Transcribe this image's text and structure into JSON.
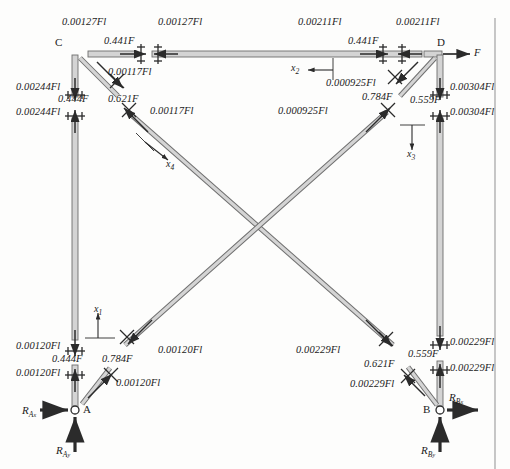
{
  "figure": {
    "type": "free-body-diagram",
    "title": "",
    "ink_color": "#2b2b2b",
    "member_fill": "#d9d9d9",
    "member_stroke": "#6e6e6e"
  },
  "nodes": {
    "C": {
      "label": "C",
      "x": 75,
      "y": 55
    },
    "D": {
      "label": "D",
      "x": 440,
      "y": 55
    },
    "A": {
      "label": "A",
      "x": 75,
      "y": 410
    },
    "B": {
      "label": "B",
      "x": 440,
      "y": 410
    }
  },
  "applied_load": {
    "label": "F",
    "at": "D",
    "direction": "right"
  },
  "reactions": [
    {
      "name": "R_Ax",
      "base": "R",
      "sub": "A",
      "comp": "x",
      "text": "R",
      "node": "A",
      "direction": "right"
    },
    {
      "name": "R_Ay",
      "base": "R",
      "sub": "A",
      "comp": "y",
      "text": "R",
      "node": "A",
      "direction": "up"
    },
    {
      "name": "R_Bx",
      "base": "R",
      "sub": "B",
      "comp": "x",
      "text": "R",
      "node": "B",
      "direction": "right"
    },
    {
      "name": "R_By",
      "base": "R",
      "sub": "B",
      "comp": "y",
      "text": "R",
      "node": "B",
      "direction": "up"
    }
  ],
  "axes": [
    {
      "name": "x1",
      "label": "x",
      "sub": "1",
      "direction": "up",
      "member": "left-column"
    },
    {
      "name": "x2",
      "label": "x",
      "sub": "2",
      "direction": "left",
      "member": "top-beam"
    },
    {
      "name": "x3",
      "label": "x",
      "sub": "3",
      "direction": "down",
      "member": "right-column"
    },
    {
      "name": "x4",
      "label": "x",
      "sub": "4",
      "direction": "down-right",
      "member": "diagonal-C-B"
    }
  ],
  "labels": [
    {
      "id": "m_c_top_left",
      "text": "0.00127Fl",
      "x": 62,
      "y": 22,
      "kind": "moment",
      "member": "top-beam-left-end"
    },
    {
      "id": "m_c_top_right",
      "text": "0.00127Fl",
      "x": 158,
      "y": 22,
      "kind": "moment",
      "member": "top-beam-left-end"
    },
    {
      "id": "f_c_top",
      "text": "0.441F",
      "x": 108,
      "y": 41,
      "kind": "force",
      "member": "top-beam-left-end"
    },
    {
      "id": "m_c_diag",
      "text": "0.00117Fl",
      "x": 110,
      "y": 68,
      "kind": "moment",
      "member": "diagonal-C-B"
    },
    {
      "id": "m_c_col_upper",
      "text": "0.00244Fl",
      "x": 18,
      "y": 86,
      "kind": "moment",
      "member": "left-column-top"
    },
    {
      "id": "f_c_col",
      "text": "0.444F",
      "x": 60,
      "y": 98,
      "kind": "force",
      "member": "left-column-top"
    },
    {
      "id": "m_c_col_lower",
      "text": "0.00244Fl",
      "x": 18,
      "y": 112,
      "kind": "moment",
      "member": "left-column-top"
    },
    {
      "id": "f_diag_c",
      "text": "0.621F",
      "x": 110,
      "y": 98,
      "kind": "force",
      "member": "diagonal-C-B"
    },
    {
      "id": "m_diag_c",
      "text": "0.00117Fl",
      "x": 152,
      "y": 110,
      "kind": "moment",
      "member": "diagonal-C-B"
    },
    {
      "id": "m_d_top_left",
      "text": "0.00211Fl",
      "x": 300,
      "y": 22,
      "kind": "moment",
      "member": "top-beam-right-end"
    },
    {
      "id": "m_d_top_right",
      "text": "0.00211Fl",
      "x": 398,
      "y": 22,
      "kind": "moment",
      "member": "top-beam-right-end"
    },
    {
      "id": "f_d_top",
      "text": "0.441F",
      "x": 352,
      "y": 41,
      "kind": "force",
      "member": "top-beam-right-end"
    },
    {
      "id": "m_d_diag",
      "text": "0.000925Fl",
      "x": 330,
      "y": 82,
      "kind": "moment",
      "member": "diagonal-D-A"
    },
    {
      "id": "m_d_col_upper",
      "text": "0.00304Fl",
      "x": 452,
      "y": 86,
      "kind": "moment",
      "member": "right-column-top"
    },
    {
      "id": "f_d_col",
      "text": "0.559F",
      "x": 412,
      "y": 99,
      "kind": "force",
      "member": "right-column-top"
    },
    {
      "id": "m_d_col_lower",
      "text": "0.00304Fl",
      "x": 452,
      "y": 112,
      "kind": "moment",
      "member": "right-column-top"
    },
    {
      "id": "f_diag_d",
      "text": "0.784F",
      "x": 364,
      "y": 96,
      "kind": "force",
      "member": "diagonal-D-A"
    },
    {
      "id": "m_diag_d",
      "text": "0.000925Fl",
      "x": 282,
      "y": 110,
      "kind": "moment",
      "member": "diagonal-D-A"
    },
    {
      "id": "m_a_col_upper",
      "text": "0.00120Fl",
      "x": 18,
      "y": 345,
      "kind": "moment",
      "member": "left-column-bottom"
    },
    {
      "id": "f_a_col",
      "text": "0.444F",
      "x": 54,
      "y": 358,
      "kind": "force",
      "member": "left-column-bottom"
    },
    {
      "id": "m_a_col_lower",
      "text": "0.00120Fl",
      "x": 18,
      "y": 372,
      "kind": "moment",
      "member": "left-column-bottom"
    },
    {
      "id": "f_diag_a",
      "text": "0.784F",
      "x": 104,
      "y": 358,
      "kind": "force",
      "member": "diagonal-D-A"
    },
    {
      "id": "m_diag_a_upper",
      "text": "0.00120Fl",
      "x": 160,
      "y": 349,
      "kind": "moment",
      "member": "diagonal-D-A"
    },
    {
      "id": "m_diag_a_lower",
      "text": "0.00120Fl",
      "x": 118,
      "y": 382,
      "kind": "moment",
      "member": "diagonal-D-A"
    },
    {
      "id": "m_b_col_upper",
      "text": "0.00229Fl",
      "x": 452,
      "y": 341,
      "kind": "moment",
      "member": "right-column-bottom"
    },
    {
      "id": "f_b_col",
      "text": "0.559F",
      "x": 412,
      "y": 353,
      "kind": "force",
      "member": "right-column-bottom"
    },
    {
      "id": "m_b_col_lower",
      "text": "0.00229Fl",
      "x": 452,
      "y": 367,
      "kind": "moment",
      "member": "right-column-bottom"
    },
    {
      "id": "m_diag_b_upper",
      "text": "0.00229Fl",
      "x": 300,
      "y": 349,
      "kind": "moment",
      "member": "diagonal-C-B"
    },
    {
      "id": "f_diag_b",
      "text": "0.621F",
      "x": 366,
      "y": 363,
      "kind": "force",
      "member": "diagonal-C-B"
    },
    {
      "id": "m_diag_b_lower",
      "text": "0.00229Fl",
      "x": 352,
      "y": 383,
      "kind": "moment",
      "member": "diagonal-C-B"
    }
  ],
  "members": [
    {
      "id": "top-beam",
      "from": "C",
      "to": "D",
      "orientation": "horizontal"
    },
    {
      "id": "left-column",
      "from": "C",
      "to": "A",
      "orientation": "vertical"
    },
    {
      "id": "right-column",
      "from": "D",
      "to": "B",
      "orientation": "vertical"
    },
    {
      "id": "diagonal-C-B",
      "from": "C",
      "to": "B",
      "orientation": "diagonal"
    },
    {
      "id": "diagonal-D-A",
      "from": "D",
      "to": "A",
      "orientation": "diagonal"
    }
  ]
}
